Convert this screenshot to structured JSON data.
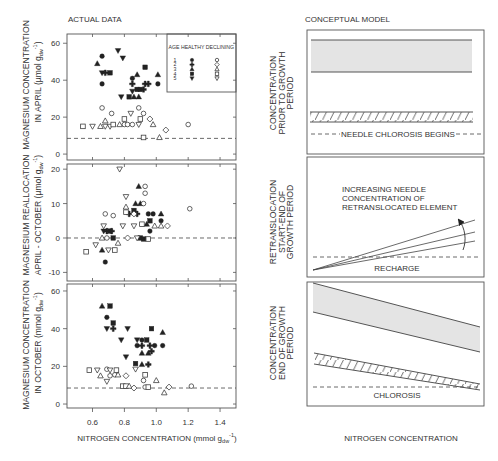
{
  "left_column": {
    "title": "ACTUAL DATA",
    "x_axis_label": {
      "main": "NITROGEN CONCENTRATION (mmol g",
      "sub": "dw",
      "sup": "-1",
      "suffix": ")"
    }
  },
  "right_column": {
    "title": "CONCEPTUAL MODEL",
    "x_axis_label": "NITROGEN CONCENTRATION"
  },
  "legend": {
    "header": "AGE HEALTHY DECLINING",
    "rows": [
      {
        "age": "1",
        "healthy": "circle-filled",
        "declining": "circle-open"
      },
      {
        "age": "2",
        "healthy": "cross-filled",
        "declining": "diamond-open"
      },
      {
        "age": "3",
        "healthy": "triangle-up-filled",
        "declining": "triangle-up-open"
      },
      {
        "age": "4",
        "healthy": "square-filled",
        "declining": "square-open"
      },
      {
        "age": "5",
        "healthy": "triangle-down-filled",
        "declining": "triangle-down-open"
      }
    ]
  },
  "chart_data": [
    {
      "id": "april",
      "type": "scatter",
      "title": "ACTUAL DATA",
      "ylabel": {
        "line1": "MAGNESIUM CONCENTRATION",
        "line2": "IN APRIL ",
        "unit_prefix": "(µmol g",
        "unit_sub": "dw",
        "unit_sup": "-1",
        "unit_suffix": ")"
      },
      "xlabel": "",
      "xlim": [
        0.44,
        1.5
      ],
      "ylim": [
        -3.2,
        65
      ],
      "xticks": [
        0.6,
        0.8,
        1.0,
        1.2,
        1.4
      ],
      "xtick_labels": [],
      "yticks": [
        0,
        20,
        40,
        60
      ],
      "ytick_labels": [
        "0",
        "20",
        "40",
        "60"
      ],
      "grid": false,
      "legend_position": "upper right",
      "reference_line": {
        "y": 8.5,
        "style": "dashed"
      },
      "series": [
        {
          "name": "Healthy",
          "points": [
            [
              0.63,
              49,
              3
            ],
            [
              0.66,
              53,
              1
            ],
            [
              0.66,
              44,
              5
            ],
            [
              0.68,
              44,
              2
            ],
            [
              0.71,
              44,
              4
            ],
            [
              0.66,
              38,
              1
            ],
            [
              0.76,
              56,
              5
            ],
            [
              0.79,
              52,
              5
            ],
            [
              0.78,
              31,
              5
            ],
            [
              0.83,
              31,
              4
            ],
            [
              0.85,
              41,
              1
            ],
            [
              0.85,
              38,
              2
            ],
            [
              0.88,
              43,
              3
            ],
            [
              0.93,
              47,
              4
            ],
            [
              0.86,
              31,
              3
            ],
            [
              0.89,
              31,
              3
            ],
            [
              0.85,
              34,
              5
            ],
            [
              0.88,
              35,
              4
            ],
            [
              0.9,
              35,
              4
            ],
            [
              0.92,
              35,
              2
            ],
            [
              0.93,
              38,
              2
            ],
            [
              0.95,
              38,
              2
            ],
            [
              1.01,
              38,
              1
            ],
            [
              1.01,
              43,
              3
            ]
          ]
        },
        {
          "name": "Declining",
          "points": [
            [
              0.66,
              25,
              1
            ],
            [
              0.72,
              22,
              1
            ],
            [
              0.89,
              25,
              1
            ],
            [
              0.92,
              22,
              1
            ],
            [
              0.96,
              19,
              2
            ],
            [
              1.2,
              16,
              1
            ],
            [
              1.06,
              13,
              2
            ],
            [
              0.98,
              16,
              3
            ],
            [
              0.68,
              18,
              3
            ],
            [
              1.02,
              9,
              3
            ],
            [
              0.92,
              9,
              4
            ],
            [
              0.54,
              15,
              4
            ],
            [
              0.6,
              15,
              5
            ],
            [
              0.65,
              15,
              3
            ],
            [
              0.68,
              15,
              5
            ],
            [
              0.71,
              15,
              5
            ],
            [
              0.73,
              16,
              4
            ],
            [
              0.77,
              16,
              3
            ],
            [
              0.8,
              16,
              1
            ],
            [
              0.82,
              16,
              1
            ],
            [
              0.85,
              16,
              1
            ],
            [
              0.8,
              19,
              4
            ],
            [
              0.84,
              22,
              5
            ],
            [
              0.9,
              19,
              4
            ],
            [
              0.89,
              16,
              5
            ]
          ]
        }
      ]
    },
    {
      "id": "reallocation",
      "type": "scatter",
      "title": "",
      "ylabel": {
        "line1": "MAGNESIUM REALLOCATION",
        "line2": "APRIL - OCTOBER ",
        "unit_prefix": "(µmol g",
        "unit_sub": "dw",
        "unit_sup": "-1",
        "unit_suffix": ")"
      },
      "xlabel": "",
      "xlim": [
        0.44,
        1.5
      ],
      "ylim": [
        -12.5,
        21.5
      ],
      "xticks": [
        0.6,
        0.8,
        1.0,
        1.2,
        1.4
      ],
      "xtick_labels": [],
      "yticks": [
        -10,
        0,
        10,
        20
      ],
      "ytick_labels": [
        "-10",
        "0",
        "10",
        "20"
      ],
      "grid": false,
      "reference_line": {
        "y": 0,
        "style": "dashed"
      },
      "series": [
        {
          "name": "Healthy",
          "points": [
            [
              0.89,
              15,
              3
            ],
            [
              0.87,
              10,
              3
            ],
            [
              0.9,
              10,
              3
            ],
            [
              0.86,
              8,
              4
            ],
            [
              0.83,
              7,
              2
            ],
            [
              0.88,
              7,
              2
            ],
            [
              0.95,
              7,
              1
            ],
            [
              0.98,
              7,
              1
            ],
            [
              1.03,
              7,
              3
            ],
            [
              0.96,
              5,
              4
            ],
            [
              1.03,
              5,
              1
            ],
            [
              0.94,
              4,
              3
            ],
            [
              0.69,
              2,
              2
            ],
            [
              0.71,
              2,
              4
            ],
            [
              0.72,
              2,
              2
            ],
            [
              0.67,
              2,
              5
            ],
            [
              0.96,
              2,
              1
            ],
            [
              0.73,
              0,
              4
            ],
            [
              0.9,
              0,
              4
            ],
            [
              0.92,
              -0.3,
              4
            ],
            [
              0.66,
              -3.5,
              3
            ],
            [
              0.68,
              -7,
              1
            ]
          ]
        },
        {
          "name": "Declining",
          "points": [
            [
              0.77,
              20,
              5
            ],
            [
              0.93,
              15,
              1
            ],
            [
              0.93,
              13,
              1
            ],
            [
              0.81,
              12,
              5
            ],
            [
              0.92,
              10,
              1
            ],
            [
              0.81,
              9,
              3
            ],
            [
              0.81,
              7.5,
              4
            ],
            [
              0.86,
              7,
              2
            ],
            [
              0.68,
              7,
              1
            ],
            [
              0.73,
              6.5,
              1
            ],
            [
              1.21,
              8.5,
              1
            ],
            [
              0.91,
              4,
              4
            ],
            [
              0.99,
              3.5,
              3
            ],
            [
              1.03,
              3.5,
              3
            ],
            [
              1.07,
              3.5,
              2
            ],
            [
              0.79,
              3.5,
              5
            ],
            [
              0.86,
              3.5,
              5
            ],
            [
              0.67,
              3.5,
              5
            ],
            [
              0.66,
              0,
              3
            ],
            [
              0.69,
              0,
              1
            ],
            [
              0.82,
              0,
              2
            ],
            [
              0.88,
              0,
              5
            ],
            [
              0.95,
              -0.3,
              4
            ],
            [
              0.62,
              -2,
              5
            ],
            [
              0.76,
              -1.5,
              3
            ],
            [
              0.7,
              -3.5,
              5
            ],
            [
              0.74,
              -3.5,
              4
            ],
            [
              0.56,
              -4,
              4
            ]
          ]
        }
      ]
    },
    {
      "id": "october",
      "type": "scatter",
      "title": "",
      "ylabel": {
        "line1": "MAGNESIUM CONCENTRATION",
        "line2": "IN OCTOBER ",
        "unit_prefix": "(mmol g",
        "unit_sub": "dw",
        "unit_sup": "-1",
        "unit_suffix": ")"
      },
      "xlabel": "NITROGEN CONCENTRATION (mmol g_dw^-1)",
      "xlim": [
        0.44,
        1.5
      ],
      "ylim": [
        -2.1,
        63.7
      ],
      "xticks": [
        0.6,
        0.8,
        1.0,
        1.2,
        1.4
      ],
      "xtick_labels": [
        "0.6",
        "0.8",
        "1.0",
        "1.2",
        "1.4"
      ],
      "yticks": [
        0,
        20,
        40,
        60
      ],
      "ytick_labels": [
        "0",
        "20",
        "40",
        "60"
      ],
      "grid": false,
      "reference_line": {
        "y": 8.5,
        "style": "dashed"
      },
      "series": [
        {
          "name": "Healthy",
          "points": [
            [
              0.66,
              52,
              3
            ],
            [
              0.71,
              52,
              4
            ],
            [
              0.69,
              46,
              1
            ],
            [
              0.73,
              43,
              4
            ],
            [
              0.69,
              40,
              5
            ],
            [
              0.73,
              40,
              2
            ],
            [
              0.82,
              40,
              5
            ],
            [
              0.97,
              40,
              4
            ],
            [
              1.04,
              38,
              3
            ],
            [
              0.78,
              34,
              5
            ],
            [
              0.88,
              34,
              5
            ],
            [
              0.91,
              34,
              1
            ],
            [
              0.94,
              34,
              4
            ],
            [
              0.88,
              31,
              1
            ],
            [
              0.91,
              31,
              2
            ],
            [
              0.96,
              31,
              2
            ],
            [
              0.99,
              31,
              1
            ],
            [
              1.04,
              31,
              1
            ],
            [
              0.91,
              27,
              3
            ],
            [
              0.95,
              27,
              3
            ],
            [
              0.97,
              28,
              2
            ],
            [
              0.81,
              25,
              5
            ],
            [
              0.87,
              21.5,
              4
            ],
            [
              0.91,
              21,
              3
            ],
            [
              0.95,
              21,
              2
            ]
          ]
        },
        {
          "name": "Declining",
          "points": [
            [
              0.58,
              18,
              4
            ],
            [
              0.63,
              18,
              5
            ],
            [
              0.69,
              18.5,
              1
            ],
            [
              0.71,
              18,
              5
            ],
            [
              0.75,
              18,
              4
            ],
            [
              0.87,
              18.5,
              5
            ],
            [
              0.65,
              15,
              3
            ],
            [
              0.71,
              15,
              1
            ],
            [
              0.74,
              15.5,
              1
            ],
            [
              0.76,
              15.5,
              3
            ],
            [
              0.81,
              15,
              2
            ],
            [
              0.93,
              15.5,
              4
            ],
            [
              0.69,
              12,
              5
            ],
            [
              0.92,
              12.5,
              1
            ],
            [
              1.0,
              12.5,
              3
            ],
            [
              0.79,
              9.5,
              4
            ],
            [
              0.81,
              9.5,
              4
            ],
            [
              0.83,
              9.5,
              3
            ],
            [
              0.86,
              8.5,
              2
            ],
            [
              0.93,
              9,
              1
            ],
            [
              0.95,
              9,
              4
            ],
            [
              1.08,
              9,
              2
            ],
            [
              1.22,
              9.5,
              1
            ],
            [
              1.05,
              6,
              3
            ]
          ]
        }
      ]
    },
    {
      "id": "conceptual-model",
      "type": "diagram",
      "title": "CONCEPTUAL MODEL",
      "xlabel": "NITROGEN CONCENTRATION",
      "panels": [
        {
          "label_lines": [
            "CONCENTRATION",
            "PRIOR TO GROWTH",
            "PERIOD"
          ],
          "elements": [
            "flat shaded band (healthy)",
            "flat hatched band (declining)",
            "dashed threshold line"
          ],
          "annotation": "NEEDLE CHLOROSIS BEGINS"
        },
        {
          "label_lines": [
            "RETRANSLOCATION",
            "START-END OF",
            "GROWTH PERIOD"
          ],
          "elements": [
            "three diverging lines from origin",
            "curved arrow upward",
            "dashed recharge line"
          ],
          "annotation_lines": [
            "INCREASING NEEDLE",
            "CONCENTRATION OF",
            "RETRANSLOCATED ELEMENT"
          ],
          "baseline_label": "RECHARGE"
        },
        {
          "label_lines": [
            "CONCENTRATION",
            "END OF GROWTH",
            "PERIOD"
          ],
          "elements": [
            "declining shaded band (healthy)",
            "declining hatched band (declining)",
            "dashed chlorosis line"
          ],
          "annotation": "CHLOROSIS"
        }
      ]
    }
  ]
}
